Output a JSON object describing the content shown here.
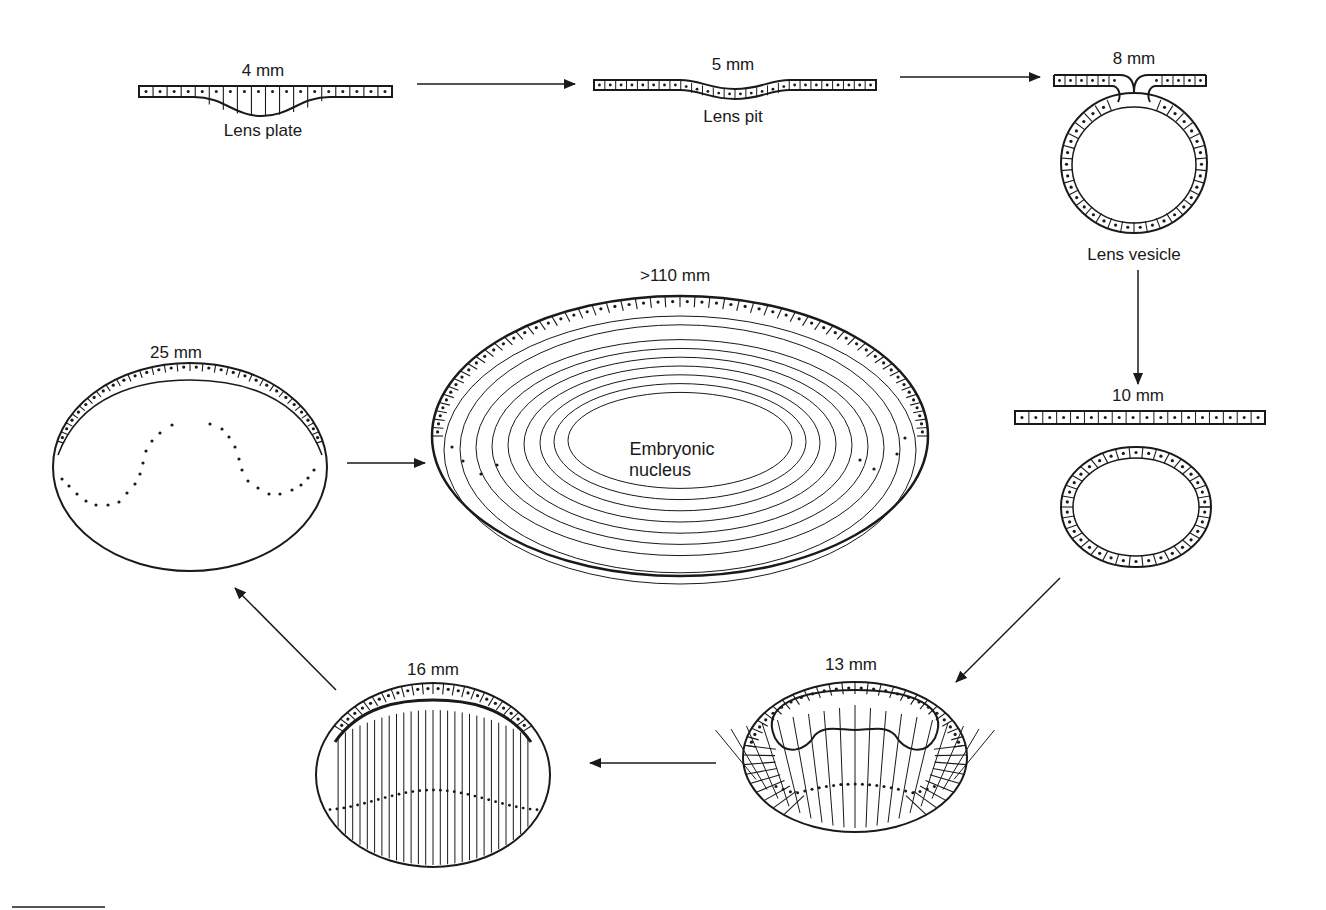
{
  "diagram": {
    "stages": [
      {
        "id": "s4",
        "size": "4 mm",
        "name": "Lens plate"
      },
      {
        "id": "s5",
        "size": "5 mm",
        "name": "Lens pit"
      },
      {
        "id": "s8",
        "size": "8 mm",
        "name": "Lens vesicle"
      },
      {
        "id": "s10",
        "size": "10 mm",
        "name": ""
      },
      {
        "id": "s13",
        "size": "13 mm",
        "name": ""
      },
      {
        "id": "s16",
        "size": "16 mm",
        "name": ""
      },
      {
        "id": "s25",
        "size": "25 mm",
        "name": ""
      },
      {
        "id": "s110",
        "size": ">110 mm",
        "name": ""
      }
    ],
    "nucleus_label_line1": "Embryonic",
    "nucleus_label_line2": "nucleus",
    "flow": [
      "4 mm",
      "5 mm",
      "8 mm",
      "10 mm",
      "13 mm",
      "16 mm",
      "25 mm",
      ">110 mm"
    ],
    "colors": {
      "ink": "#1a1a1a",
      "background": "#ffffff"
    }
  }
}
